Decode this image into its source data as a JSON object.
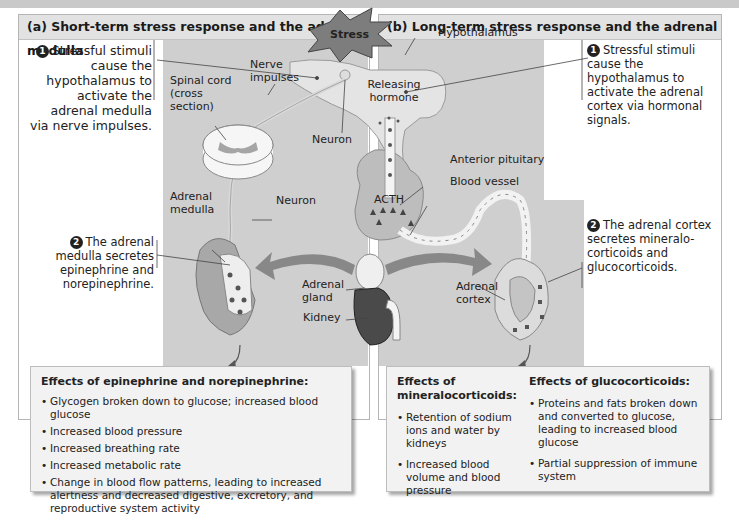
{
  "figure": {
    "colors": {
      "panel_header_bg": "#e2e2e2",
      "diagram_gray": "#cfcfcf",
      "effects_bg": "#f2f2f2",
      "stress_burst": "#7d7d7d"
    }
  },
  "panel_a": {
    "title": "(a) Short-term stress response and the adrenal medulla",
    "step1": {
      "num": "1",
      "text": "Stressful stimuli cause the hypothalamus to activate the adrenal medulla via nerve impulses."
    },
    "step2": {
      "num": "2",
      "text": "The adrenal medulla secretes epinephrine and norepinephrine."
    },
    "labels": {
      "spinal_cord": "Spinal cord (cross section)",
      "nerve_impulses": "Nerve impulses",
      "neuron_top": "Neuron",
      "neuron_mid": "Neuron",
      "adrenal_medulla": "Adrenal medulla"
    },
    "effects": {
      "title": "Effects of epinephrine and norepinephrine:",
      "items": [
        "Glycogen broken down to glucose; increased blood glucose",
        "Increased blood pressure",
        "Increased breathing rate",
        "Increased metabolic rate",
        "Change in blood flow patterns, leading to increased alertness and decreased digestive, excretory, and reproductive system activity"
      ]
    }
  },
  "panel_b": {
    "title": "(b) Long-term stress response and the adrenal cortex",
    "step1": {
      "num": "1",
      "text": "Stressful stimuli cause the hypothalamus to activate the adrenal cortex via hormonal signals."
    },
    "step2": {
      "num": "2",
      "text": "The adrenal cortex secretes mineralo-corticoids and glucocorticoids."
    },
    "labels": {
      "hypothalamus": "Hypothalamus",
      "releasing_hormone": "Releasing hormone",
      "anterior_pituitary": "Anterior pituitary",
      "blood_vessel": "Blood vessel",
      "acth": "ACTH",
      "adrenal_cortex": "Adrenal cortex"
    },
    "effects_mineralo": {
      "title": "Effects of mineralocorticoids:",
      "items": [
        "Retention of sodium ions and water by kidneys",
        "Increased blood volume and blood pressure"
      ]
    },
    "effects_gluco": {
      "title": "Effects of glucocorticoids:",
      "items": [
        "Proteins and fats broken down and converted to glucose, leading to increased blood glucose",
        "Partial suppression of immune system"
      ]
    }
  },
  "center": {
    "stress": "Stress",
    "adrenal_gland": "Adrenal gland",
    "kidney": "Kidney"
  }
}
